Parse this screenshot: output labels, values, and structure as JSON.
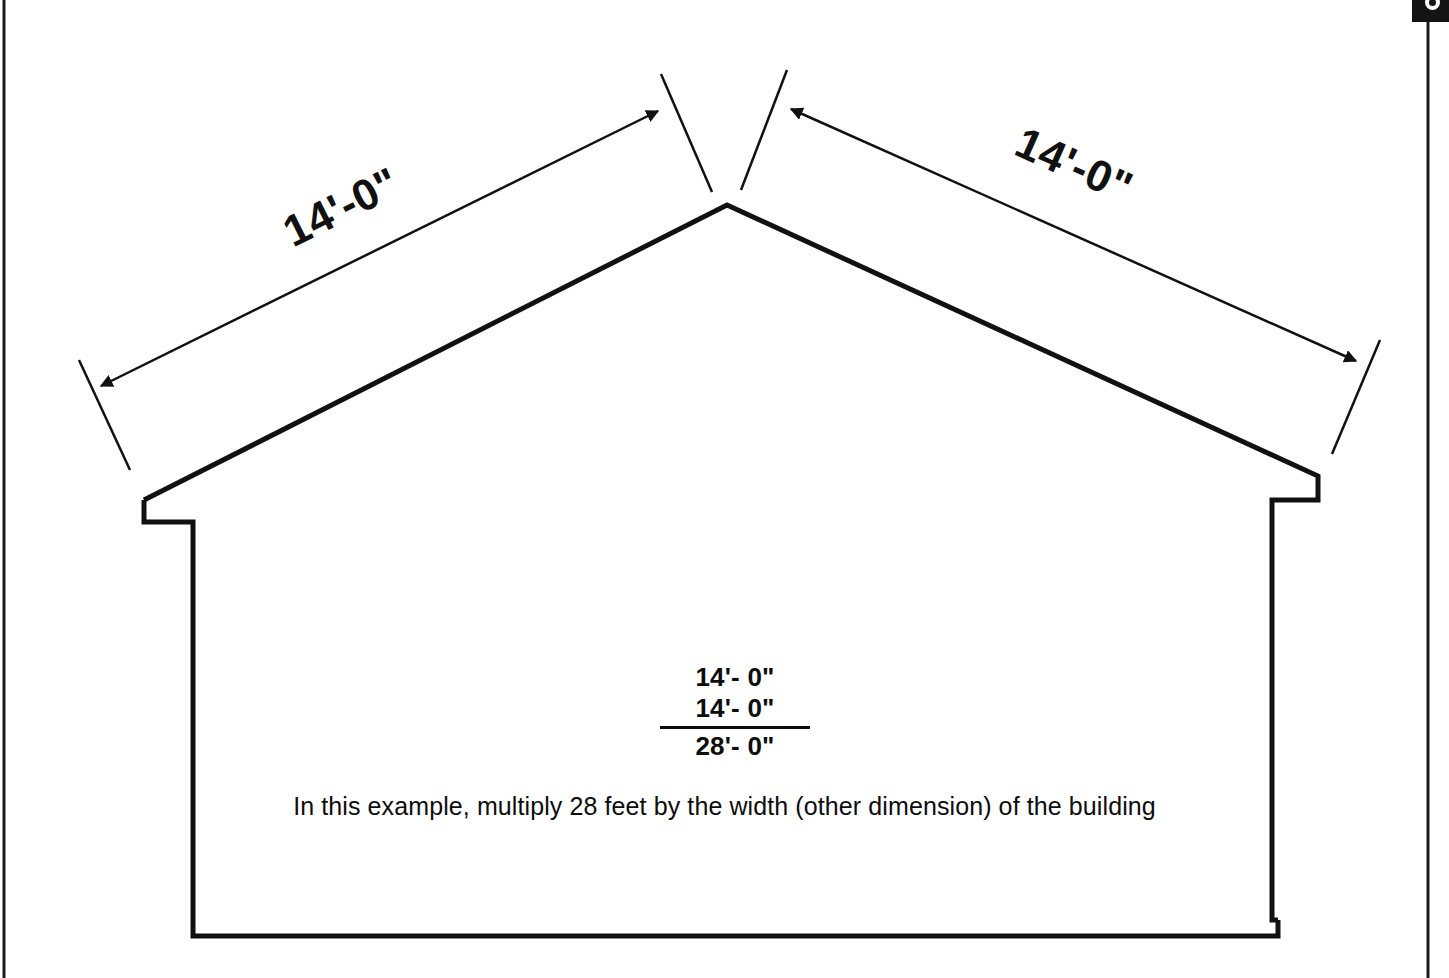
{
  "document": {
    "type": "architectural-section-diagram",
    "subject": "gable roof building cross-section with slope dimensions"
  },
  "dimensions": {
    "left_slope_label": "14'-0\"",
    "right_slope_label": "14'-0\""
  },
  "calculation": {
    "addend_1": "14'- 0\"",
    "addend_2": "14'- 0\"",
    "total": "28'- 0\""
  },
  "caption": {
    "text": "In this example, multiply 28 feet by the width (other dimension) of the building"
  },
  "icons": {
    "corner_tab": "circle-marker-icon"
  },
  "colors": {
    "ink": "#111111",
    "paper": "#ffffff",
    "tab": "#141414"
  },
  "geometry": {
    "roof_peak": [
      727,
      205
    ],
    "left_eave": [
      144,
      500
    ],
    "right_eave": [
      1318,
      476
    ],
    "floor_left": [
      194,
      936
    ],
    "floor_right": [
      1278,
      920
    ]
  }
}
